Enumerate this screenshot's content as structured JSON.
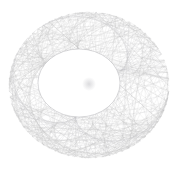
{
  "figure": {
    "type": "string-art-caustic",
    "background_color": "#ffffff",
    "line_color": "#b9b9bd",
    "line_color_dark": "#8f8f96",
    "line_width": 0.35,
    "line_opacity": 0.55,
    "canvas": {
      "width": 178,
      "height": 170
    },
    "outer_circle": {
      "center_x": 89,
      "center_y": 85,
      "radius_x": 80,
      "radius_y": 73,
      "point_count": 72,
      "start_angle_deg": 0
    },
    "chord_rule": {
      "description": "each point i connects to point (i*k) mod n",
      "multiplier": 2.62,
      "step_mode": "modular-multiplier"
    },
    "envelope_circle": {
      "center_x": 79,
      "center_y": 83,
      "radius_x": 41,
      "radius_y": 34,
      "fill_color": "#ffffff",
      "edge_color": "#9b9ba1"
    },
    "center_blob": {
      "center_x": 89,
      "center_y": 84,
      "radius": 7,
      "color": "#b0b0b6",
      "opacity": 0.45
    },
    "margins": {
      "left": 10,
      "top": 12,
      "right": 10,
      "bottom": 14
    }
  }
}
